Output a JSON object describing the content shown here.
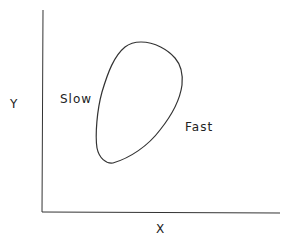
{
  "diagram": {
    "labels": {
      "y_axis": "Y",
      "x_axis": "X",
      "slow": "Slow",
      "fast": "Fast"
    },
    "colors": {
      "line": "#333333",
      "background": "#ffffff"
    }
  }
}
